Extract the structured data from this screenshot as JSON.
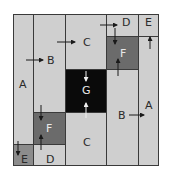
{
  "diagram": {
    "cells": [
      {
        "id": "A-left",
        "label": "A",
        "shade": "light"
      },
      {
        "id": "E-bottom-left",
        "label": "E",
        "shade": "medium"
      },
      {
        "id": "B-left",
        "label": "B",
        "shade": "light"
      },
      {
        "id": "F-left",
        "label": "F",
        "shade": "dark-gray"
      },
      {
        "id": "D-bottom",
        "label": "D",
        "shade": "light"
      },
      {
        "id": "C-top",
        "label": "C",
        "shade": "light"
      },
      {
        "id": "G-center",
        "label": "G",
        "shade": "black"
      },
      {
        "id": "C-bottom",
        "label": "C",
        "shade": "light"
      },
      {
        "id": "D-top",
        "label": "D",
        "shade": "light"
      },
      {
        "id": "F-right",
        "label": "F",
        "shade": "dark-gray"
      },
      {
        "id": "B-right",
        "label": "B",
        "shade": "light"
      },
      {
        "id": "E-top-right",
        "label": "E",
        "shade": "light"
      },
      {
        "id": "A-right",
        "label": "A",
        "shade": "light"
      }
    ],
    "colors": {
      "light": "#cfcfcf",
      "dark_gray": "#6b6b6b",
      "black": "#0a0a0a",
      "medium": "#8c8c8c",
      "border": "#3a3a3a"
    }
  }
}
